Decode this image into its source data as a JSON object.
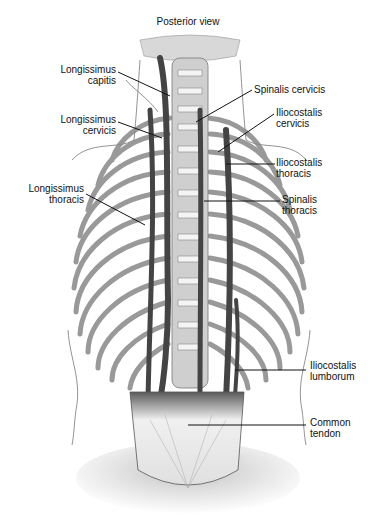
{
  "title": "Posterior view",
  "labels": {
    "longissimus_capitis": {
      "line1": "Longissimus",
      "line2": "capitis"
    },
    "longissimus_cervicis": {
      "line1": "Longissimus",
      "line2": "cervicis"
    },
    "longissimus_thoracis": {
      "line1": "Longissimus",
      "line2": "thoracis"
    },
    "spinalis_cervicis": {
      "line1": "Spinalis cervicis"
    },
    "iliocostalis_cervicis": {
      "line1": "Iliocostalis",
      "line2": "cervicis"
    },
    "iliocostalis_thoracis": {
      "line1": "Iliocostalis",
      "line2": "thoracis"
    },
    "spinalis_thoracis": {
      "line1": "Spinalis",
      "line2": "thoracis"
    },
    "iliocostalis_lumborum": {
      "line1": "Iliocostalis",
      "line2": "lumborum"
    },
    "common_tendon": {
      "line1": "Common",
      "line2": "tendon"
    }
  },
  "colors": {
    "muscle": "#4a4a4a",
    "bone": "#bdbdbd",
    "outline": "#555555",
    "tendon": "#e8e8e8",
    "leader": "#111111"
  }
}
